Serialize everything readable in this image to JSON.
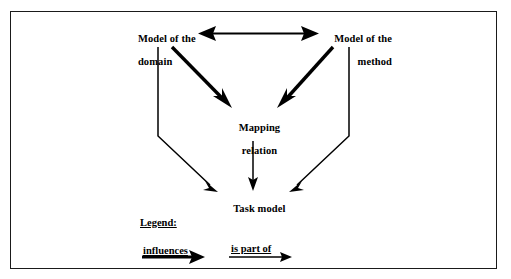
{
  "figure": {
    "background_color": "#ffffff",
    "line_color": "#000000",
    "border_color": "#1a1a1a"
  },
  "nodes": {
    "model_domain": {
      "line1": "Model of the",
      "line2": "domain"
    },
    "model_method": {
      "line1": "Model of the",
      "line2": "method"
    },
    "mapping_relation": {
      "line1": "Mapping",
      "line2": "relation"
    },
    "task_model": {
      "line1": "Task model"
    }
  },
  "legend": {
    "title": "Legend:",
    "entries": [
      {
        "label": "influences",
        "arrow_style": "thick-solid-arrow"
      },
      {
        "label": "is part of",
        "arrow_style": "thin-solid-arrow"
      }
    ]
  },
  "edges": [
    {
      "name": "domain-method-bidirectional",
      "from": "model_domain",
      "to": "model_method",
      "type": "influences",
      "arrowheads": "both",
      "style": "double-headed-horizontal"
    },
    {
      "name": "domain-to-mapping",
      "from": "model_domain",
      "to": "mapping_relation",
      "type": "influences",
      "arrowheads": "end",
      "style": "thick-diagonal"
    },
    {
      "name": "method-to-mapping",
      "from": "model_method",
      "to": "mapping_relation",
      "type": "influences",
      "arrowheads": "end",
      "style": "thick-diagonal"
    },
    {
      "name": "domain-to-task-model",
      "from": "model_domain",
      "to": "task_model",
      "type": "is part of",
      "arrowheads": "end",
      "style": "thin-elbow"
    },
    {
      "name": "method-to-task-model",
      "from": "model_method",
      "to": "task_model",
      "type": "is part of",
      "arrowheads": "end",
      "style": "thin-elbow"
    },
    {
      "name": "mapping-to-task-model",
      "from": "mapping_relation",
      "to": "task_model",
      "type": "is part of",
      "arrowheads": "end",
      "style": "thin-vertical"
    }
  ]
}
